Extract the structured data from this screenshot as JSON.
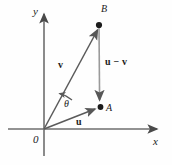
{
  "figure": {
    "type": "vector-diagram",
    "background_color": "#fefefe",
    "stroke_color": "#5a5a5a",
    "text_color": "#1b1b1b",
    "width": 172,
    "height": 165
  },
  "axes": {
    "x_label": "x",
    "y_label": "y",
    "origin_label": "0",
    "origin": {
      "x": 44,
      "y": 129
    },
    "x_axis": {
      "x1": 8,
      "y1": 129,
      "x2": 160,
      "y2": 129
    },
    "y_axis": {
      "x1": 44,
      "y1": 11,
      "x2": 44,
      "y2": 156
    }
  },
  "points": [
    {
      "name": "A",
      "label": "A",
      "x": 100,
      "y": 107
    },
    {
      "name": "B",
      "label": "B",
      "x": 99,
      "y": 25
    }
  ],
  "vectors": [
    {
      "name": "u",
      "label": "u",
      "from": {
        "x": 44,
        "y": 129
      },
      "to": {
        "x": 100,
        "y": 107
      },
      "description": "vector u from origin to point A"
    },
    {
      "name": "v",
      "label": "v",
      "from": {
        "x": 44,
        "y": 129
      },
      "to": {
        "x": 99,
        "y": 25
      },
      "description": "vector v from origin to point B"
    },
    {
      "name": "u-minus-v",
      "label": "u − v",
      "from": {
        "x": 99,
        "y": 25
      },
      "to": {
        "x": 100,
        "y": 105
      },
      "description": "vector u minus v from point B down to point A"
    }
  ],
  "angle": {
    "symbol": "θ",
    "between": [
      "u",
      "v"
    ],
    "vertex": {
      "x": 44,
      "y": 129
    }
  }
}
